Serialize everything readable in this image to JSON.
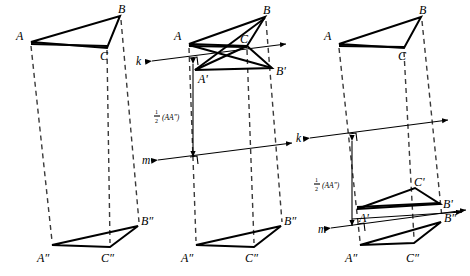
{
  "figure": {
    "background": "#ffffff",
    "ink": "#000000",
    "dash_color": "#3a3a3a",
    "width": 470,
    "height": 276
  },
  "labels": {
    "A": "A",
    "B": "B",
    "C": "C",
    "A_prime": "A'",
    "B_prime": "B'",
    "C_prime": "C'",
    "A_dprime": "A″",
    "B_dprime": "B″",
    "C_dprime": "C″",
    "line_k": "k",
    "line_m": "m",
    "half_AA": "(AA″)",
    "half_numer": "1",
    "half_denom": "2"
  },
  "panels": [
    {
      "name": "panel-left",
      "caption": "",
      "shows_mirror_lines": false,
      "triangles": [
        {
          "name": "triangle-ABC",
          "vertices": [
            [
              31,
              42
            ],
            [
              120,
              16
            ],
            [
              107,
              48
            ]
          ],
          "labels": [
            "A",
            "B",
            "C"
          ]
        },
        {
          "name": "triangle-A2B2C2",
          "vertices": [
            [
              52,
              245
            ],
            [
              138,
              226
            ],
            [
              110,
              247
            ]
          ],
          "labels": [
            "A″",
            "B″",
            "C″"
          ]
        }
      ],
      "connectors": [
        {
          "name": "connector-A-A2",
          "from": [
            31,
            46
          ],
          "to": [
            52,
            241
          ]
        },
        {
          "name": "connector-C-C2",
          "from": [
            107,
            52
          ],
          "to": [
            110,
            243
          ]
        },
        {
          "name": "connector-B-B2",
          "from": [
            121,
            20
          ],
          "to": [
            139,
            222
          ]
        }
      ]
    },
    {
      "name": "panel-middle",
      "caption": "",
      "shows_mirror_lines": true,
      "triangles": [
        {
          "name": "triangle-ABC",
          "vertices": [
            [
              189,
              44
            ],
            [
              265,
              17
            ],
            [
              247,
              46
            ]
          ],
          "labels": [
            "A",
            "B",
            "C"
          ]
        },
        {
          "name": "triangle-A1B1C1",
          "vertices": [
            [
              195,
              70
            ],
            [
              272,
              68
            ],
            [
              247,
              46
            ]
          ],
          "labels": [
            "A'",
            "B'",
            "C"
          ]
        },
        {
          "name": "triangle-A2B2C2",
          "vertices": [
            [
              196,
              245
            ],
            [
              281,
              226
            ],
            [
              254,
              247
            ]
          ],
          "labels": [
            "A″",
            "B″",
            "C″"
          ]
        }
      ],
      "lines": [
        {
          "name": "mirror-line-k",
          "label": "k",
          "from": [
            152,
            61
          ],
          "to": [
            286,
            44
          ],
          "label_pos": [
            140,
            62
          ]
        },
        {
          "name": "mirror-line-m",
          "label": "m",
          "from": [
            158,
            160
          ],
          "to": [
            292,
            143
          ],
          "label_pos": [
            146,
            161
          ]
        }
      ],
      "measure": {
        "name": "half-AA-measure",
        "from": [
          193,
          63
        ],
        "to": [
          193,
          158
        ],
        "label_pos": [
          156,
          117
        ]
      },
      "connectors": [
        {
          "name": "connector-A-A2",
          "from": [
            189,
            48
          ],
          "to": [
            196,
            241
          ]
        },
        {
          "name": "connector-C-C2",
          "from": [
            247,
            50
          ],
          "to": [
            254,
            243
          ]
        },
        {
          "name": "connector-B-B2",
          "from": [
            266,
            21
          ],
          "to": [
            282,
            222
          ]
        }
      ]
    },
    {
      "name": "panel-right",
      "caption": "",
      "shows_mirror_lines": true,
      "triangles": [
        {
          "name": "triangle-ABC",
          "vertices": [
            [
              339,
              44
            ],
            [
              421,
              17
            ],
            [
              404,
              48
            ]
          ],
          "labels": [
            "A",
            "B",
            "C"
          ]
        },
        {
          "name": "triangle-A1B1C1",
          "vertices": [
            [
              357,
              209
            ],
            [
              440,
              204
            ],
            [
              415,
              188
            ]
          ],
          "labels": [
            "A'",
            "B'",
            "C'"
          ]
        },
        {
          "name": "triangle-A2B2C2",
          "vertices": [
            [
              360,
              245
            ],
            [
              441,
              222
            ],
            [
              414,
              243
            ]
          ],
          "labels": [
            "A″",
            "B″",
            "C″"
          ]
        }
      ],
      "lines": [
        {
          "name": "mirror-line-k",
          "label": "k",
          "from": [
            310,
            138
          ],
          "to": [
            448,
            120
          ],
          "label_pos": [
            300,
            139
          ]
        },
        {
          "name": "mirror-line-m",
          "label": "m",
          "from": [
            331,
            228
          ],
          "to": [
            466,
            210
          ],
          "label_pos": [
            320,
            230
          ]
        },
        {
          "name": "axis-through-B1",
          "label": "",
          "from": [
            357,
            218
          ],
          "to": [
            462,
            211
          ],
          "label_pos": [
            0,
            0
          ]
        }
      ],
      "measure": {
        "name": "half-AA-measure",
        "from": [
          352,
          141
        ],
        "to": [
          352,
          226
        ],
        "label_pos": [
          316,
          186
        ]
      },
      "connectors": [
        {
          "name": "connector-A-A2",
          "from": [
            339,
            48
          ],
          "to": [
            360,
            241
          ]
        },
        {
          "name": "connector-C-C2",
          "from": [
            404,
            52
          ],
          "to": [
            414,
            239
          ]
        },
        {
          "name": "connector-B-B2",
          "from": [
            422,
            21
          ],
          "to": [
            442,
            218
          ]
        }
      ]
    }
  ]
}
